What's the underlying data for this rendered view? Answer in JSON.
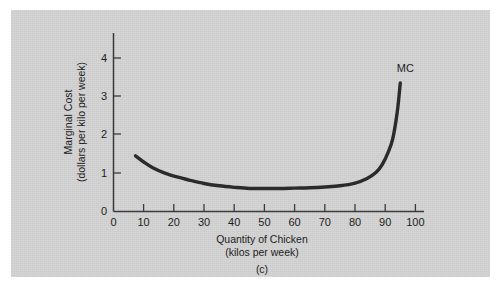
{
  "figure": {
    "caption": "(c)",
    "panel_color": "#d3d3d3",
    "curve_color": "#2b2b2b",
    "axis_color": "#3b3b3b"
  },
  "chart_data": {
    "type": "line",
    "title": "",
    "subtitle": "",
    "xlabel": "Quantity of Chicken",
    "xlabel_units": "(kilos per week)",
    "ylabel": "Marginal Cost",
    "ylabel_units": "(dollars per kilo per week)",
    "xlim": [
      0,
      103
    ],
    "ylim": [
      0,
      4.35
    ],
    "xticks": [
      0,
      10,
      20,
      30,
      40,
      50,
      60,
      70,
      80,
      90,
      100
    ],
    "xticklabels": [
      "0",
      "10",
      "20",
      "30",
      "40",
      "50",
      "60",
      "70",
      "80",
      "90",
      "100"
    ],
    "yticks": [
      0,
      1,
      2,
      3,
      4
    ],
    "yticklabels": [
      "0",
      "1",
      "2",
      "3",
      "4"
    ],
    "grid": false,
    "legend_position": "inline-right",
    "series": [
      {
        "name": "MC",
        "label": "MC",
        "annotation": "MC",
        "x": [
          7.3,
          10,
          13,
          17,
          21,
          25,
          30,
          35,
          40,
          45,
          50,
          55,
          60,
          65,
          70,
          75,
          80,
          84,
          87,
          89,
          91,
          92.5,
          94,
          95
        ],
        "values": [
          1.45,
          1.29,
          1.14,
          1.0,
          0.9,
          0.82,
          0.73,
          0.67,
          0.63,
          0.6,
          0.6,
          0.6,
          0.61,
          0.62,
          0.64,
          0.67,
          0.74,
          0.86,
          1.02,
          1.22,
          1.55,
          1.9,
          2.6,
          3.35
        ]
      }
    ]
  }
}
